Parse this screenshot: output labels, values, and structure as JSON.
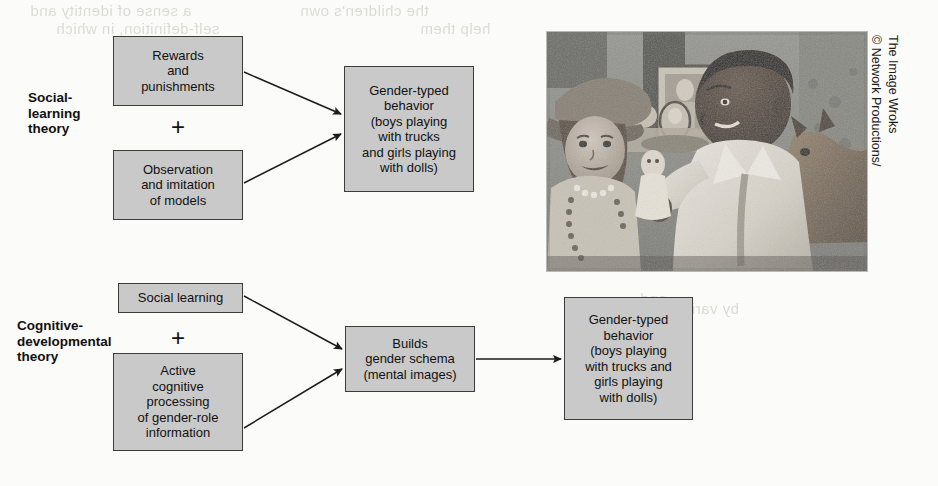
{
  "figure": {
    "background_color": "#fbfbf9",
    "node_fill": "#c9c9c9",
    "node_border": "#3c3c3c"
  },
  "rows": [
    {
      "id": "social-learning",
      "theory_label": "Social-\nlearning\ntheory",
      "operator": "+",
      "inputs": [
        {
          "id": "rewards",
          "text": "Rewards\nand\npunishments"
        },
        {
          "id": "observation",
          "text": "Observation\nand imitation\nof models"
        }
      ],
      "outcome": {
        "id": "gender-typed-behavior-1",
        "text": "Gender-typed\nbehavior\n(boys playing\nwith trucks\nand girls playing\nwith dolls)"
      }
    },
    {
      "id": "cognitive-developmental",
      "theory_label": "Cognitive-\ndevelopmental\ntheory",
      "operator": "+",
      "inputs": [
        {
          "id": "social-learning-input",
          "text": "Social learning"
        },
        {
          "id": "active-cognitive-processing",
          "text": "Active\ncognitive\nprocessing\nof gender-role\ninformation"
        }
      ],
      "intermediate": {
        "id": "builds-gender-schema",
        "text": "Builds\ngender schema\n(mental images)"
      },
      "outcome": {
        "id": "gender-typed-behavior-2",
        "text": "Gender-typed\nbehavior\n(boys playing\nwith trucks and\ngirls playing\nwith dolls)"
      }
    }
  ],
  "photo": {
    "alt": "Two young children playing dress-up; a girl wearing a hat and pearl necklace and a boy in a white coat holding a doll, with a dog resting behind them.",
    "credit_line_1": "© Network Productions/",
    "credit_line_2": "The Image Wroks"
  },
  "bleed_through": [
    "a sense of identity and",
    "self-definition, in which",
    "the children's own",
    "help them",
    "and",
    "by various methods"
  ]
}
